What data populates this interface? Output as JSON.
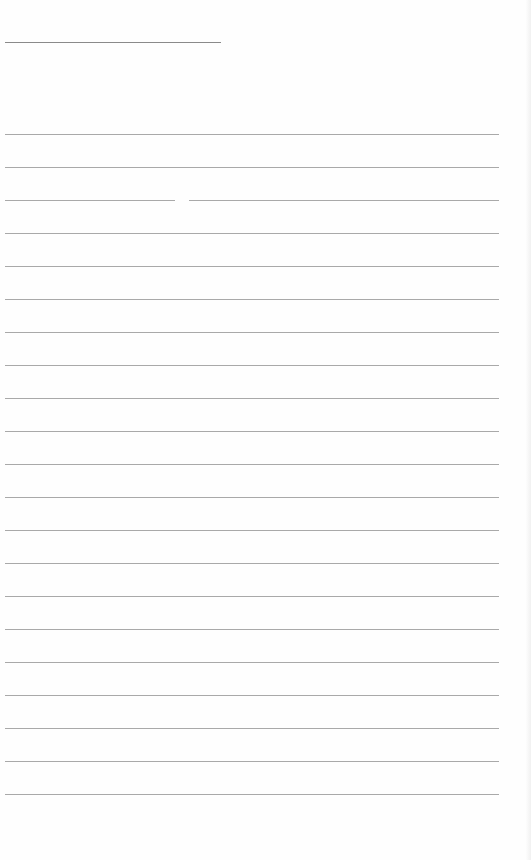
{
  "document": {
    "type": "lined-paper",
    "header_line": {
      "present": true,
      "text": ""
    },
    "rule_count": 21,
    "rule_color": "#a9a9a9",
    "paper_color": "#fefefe",
    "rules": [
      {
        "text": ""
      },
      {
        "text": ""
      },
      {
        "text": ""
      },
      {
        "text": ""
      },
      {
        "text": ""
      },
      {
        "text": ""
      },
      {
        "text": ""
      },
      {
        "text": ""
      },
      {
        "text": ""
      },
      {
        "text": ""
      },
      {
        "text": ""
      },
      {
        "text": ""
      },
      {
        "text": ""
      },
      {
        "text": ""
      },
      {
        "text": ""
      },
      {
        "text": ""
      },
      {
        "text": ""
      },
      {
        "text": ""
      },
      {
        "text": ""
      },
      {
        "text": ""
      },
      {
        "text": ""
      }
    ]
  }
}
